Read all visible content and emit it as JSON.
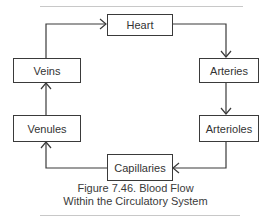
{
  "diagram": {
    "nodes": [
      {
        "id": "heart",
        "label": "Heart"
      },
      {
        "id": "arteries",
        "label": "Arteries"
      },
      {
        "id": "arterioles",
        "label": "Arterioles"
      },
      {
        "id": "capillaries",
        "label": "Capillaries"
      },
      {
        "id": "venules",
        "label": "Venules"
      },
      {
        "id": "veins",
        "label": "Veins"
      }
    ],
    "edges": [
      {
        "from": "veins",
        "to": "heart"
      },
      {
        "from": "heart",
        "to": "arteries"
      },
      {
        "from": "arteries",
        "to": "arterioles"
      },
      {
        "from": "arterioles",
        "to": "capillaries"
      },
      {
        "from": "capillaries",
        "to": "venules"
      },
      {
        "from": "venules",
        "to": "veins"
      }
    ],
    "caption": {
      "line1": "Figure 7.46. Blood Flow",
      "line2": "Within the Circulatory System"
    },
    "colors": {
      "stroke": "#3a3a3a",
      "text": "#333333",
      "rule": "#c8c8c8"
    }
  }
}
